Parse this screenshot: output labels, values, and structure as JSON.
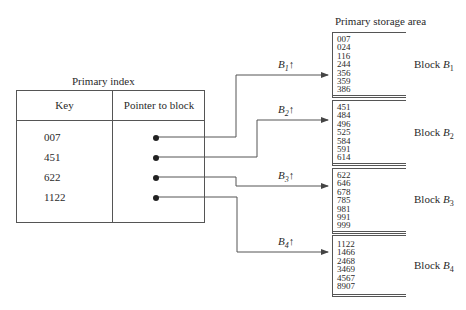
{
  "primary_index": {
    "title": "Primary index",
    "columns": [
      "Key",
      "Pointer to block"
    ],
    "rows": [
      {
        "key": "007",
        "pointer": "B1"
      },
      {
        "key": "451",
        "pointer": "B2"
      },
      {
        "key": "622",
        "pointer": "B3"
      },
      {
        "key": "1122",
        "pointer": "B4"
      }
    ]
  },
  "storage": {
    "title": "Primary storage area",
    "blocks": [
      {
        "name": "Block",
        "sub": "1",
        "pointer_label": "B",
        "values": "007\n024\n116\n244\n356\n359\n386"
      },
      {
        "name": "Block",
        "sub": "2",
        "pointer_label": "B",
        "values": "451\n484\n496\n525\n584\n591\n614"
      },
      {
        "name": "Block",
        "sub": "3",
        "pointer_label": "B",
        "values": "622\n646\n678\n785\n981\n991\n999"
      },
      {
        "name": "Block",
        "sub": "4",
        "pointer_label": "B",
        "values": "1122\n1466\n2468\n3469\n4567\n8907"
      }
    ],
    "arrow_glyph": "↑"
  }
}
